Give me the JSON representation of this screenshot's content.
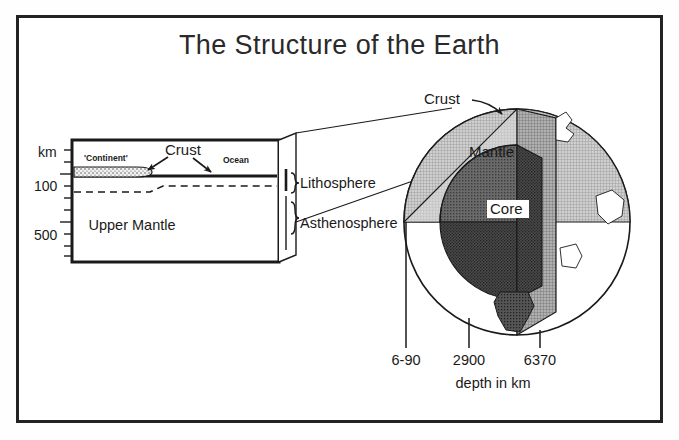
{
  "figure": {
    "title": "The Structure of the Earth",
    "caption": "depth in km"
  },
  "cross_section": {
    "axis_unit": "km",
    "axis_ticks": [
      "100",
      "500"
    ],
    "surface_labels": {
      "continent": "'Continent'",
      "ocean": "Ocean",
      "crust": "Crust"
    },
    "interior_label": "Upper Mantle",
    "layer_brackets": [
      "Lithosphere",
      "Asthenosphere"
    ]
  },
  "globe": {
    "layers": [
      "Crust",
      "Mantle",
      "Core"
    ],
    "crust_label": "Crust",
    "mantle_label": "Mantle",
    "core_label": "Core"
  },
  "depth_scale": {
    "unit_caption": "depth in km",
    "marks": [
      {
        "label": "6-90",
        "x": 406
      },
      {
        "label": "2900",
        "x": 469
      },
      {
        "label": "6370",
        "x": 540
      }
    ]
  },
  "colors": {
    "ink": "#1a1a1a",
    "frame": "#222222",
    "mantle_fill": "#b9b9b9",
    "mantle_light": "#d6d6d6",
    "core_fill": "#3b3b3b",
    "core_mid": "#585858",
    "continent_fill": "#e8e8e8",
    "paper": "#ffffff"
  }
}
